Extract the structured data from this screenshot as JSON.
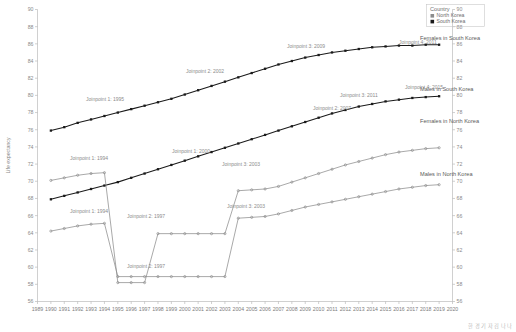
{
  "chart_data": {
    "type": "line",
    "title": "",
    "xlabel": "",
    "ylabel": "Life expectancy",
    "xlim": [
      1989,
      2020
    ],
    "ylim": [
      56,
      90
    ],
    "ytick_step": 2,
    "grid": false,
    "x_ticks": [
      "1989",
      "1990",
      "1991",
      "1992",
      "1993",
      "1994",
      "1995",
      "1996",
      "1997",
      "1998",
      "1999",
      "2000",
      "2001",
      "2002",
      "2003",
      "2004",
      "2005",
      "2006",
      "2007",
      "2008",
      "2009",
      "2010",
      "2011",
      "2012",
      "2013",
      "2014",
      "2015",
      "2016",
      "2017",
      "2018",
      "2019",
      "2020"
    ],
    "y_ticks": [
      "56",
      "58",
      "60",
      "62",
      "64",
      "66",
      "68",
      "70",
      "72",
      "74",
      "76",
      "78",
      "80",
      "82",
      "84",
      "86",
      "88",
      "90"
    ],
    "x": [
      1990,
      1991,
      1992,
      1993,
      1994,
      1995,
      1996,
      1997,
      1998,
      1999,
      2000,
      2001,
      2002,
      2003,
      2004,
      2005,
      2006,
      2007,
      2008,
      2009,
      2010,
      2011,
      2012,
      2013,
      2014,
      2015,
      2016,
      2017,
      2018,
      2019
    ],
    "series": [
      {
        "name": "Females in South Korea",
        "country": "South Korea",
        "color": "#1a1a1a",
        "marker": "square",
        "values": [
          75.9,
          76.3,
          76.8,
          77.2,
          77.6,
          78.0,
          78.4,
          78.8,
          79.2,
          79.6,
          80.1,
          80.6,
          81.1,
          81.6,
          82.1,
          82.6,
          83.1,
          83.6,
          84.0,
          84.4,
          84.7,
          85.0,
          85.2,
          85.4,
          85.6,
          85.7,
          85.8,
          85.8,
          85.9,
          85.9
        ]
      },
      {
        "name": "Males in South Korea",
        "country": "South Korea",
        "color": "#1a1a1a",
        "marker": "square",
        "values": [
          67.9,
          68.3,
          68.7,
          69.1,
          69.5,
          69.9,
          70.4,
          70.9,
          71.4,
          71.9,
          72.4,
          72.9,
          73.4,
          73.9,
          74.4,
          74.9,
          75.4,
          75.9,
          76.4,
          76.9,
          77.4,
          77.9,
          78.3,
          78.7,
          79.0,
          79.3,
          79.5,
          79.7,
          79.8,
          79.9
        ]
      },
      {
        "name": "Females in North Korea",
        "country": "North Korea",
        "color": "#8c8c8c",
        "marker": "circle",
        "values": [
          70.1,
          70.4,
          70.7,
          70.9,
          71.0,
          58.2,
          58.2,
          58.2,
          63.9,
          63.9,
          63.9,
          63.9,
          63.9,
          63.9,
          68.9,
          69.0,
          69.1,
          69.4,
          69.9,
          70.4,
          70.9,
          71.4,
          71.9,
          72.3,
          72.7,
          73.1,
          73.4,
          73.6,
          73.8,
          73.9
        ]
      },
      {
        "name": "Males in North Korea",
        "country": "North Korea",
        "color": "#8c8c8c",
        "marker": "circle",
        "values": [
          64.2,
          64.5,
          64.8,
          65.0,
          65.1,
          58.9,
          58.9,
          58.9,
          58.9,
          58.9,
          58.9,
          58.9,
          58.9,
          58.9,
          65.7,
          65.8,
          65.9,
          66.2,
          66.6,
          67.0,
          67.3,
          67.6,
          67.9,
          68.2,
          68.5,
          68.8,
          69.1,
          69.3,
          69.5,
          69.6
        ]
      }
    ],
    "annotations": [
      {
        "text": "Joinpoint 1: 1995",
        "series": "Females in South Korea"
      },
      {
        "text": "Joinpoint 2: 2002",
        "series": "Females in South Korea"
      },
      {
        "text": "Joinpoint 3: 2009",
        "series": "Females in South Korea"
      },
      {
        "text": "Joinpoint 4: 2011",
        "series": "Females in South Korea"
      },
      {
        "text": "Joinpoint 1: 2000",
        "series": "Males in South Korea"
      },
      {
        "text": "Joinpoint 2: 2007",
        "series": "Males in South Korea"
      },
      {
        "text": "Joinpoint 3: 2011",
        "series": "Males in South Korea"
      },
      {
        "text": "Joinpoint 4: 2015",
        "series": "Males in South Korea"
      },
      {
        "text": "Joinpoint 1: 1994",
        "series": "Females in North Korea"
      },
      {
        "text": "Joinpoint 2: 1997",
        "series": "Females in North Korea"
      },
      {
        "text": "Joinpoint 3: 2003",
        "series": "Females in North Korea"
      },
      {
        "text": "Joinpoint 1: 1994",
        "series": "Males in North Korea"
      },
      {
        "text": "Joinpoint 2: 1997",
        "series": "Males in North Korea"
      },
      {
        "text": "Joinpoint 3: 2003",
        "series": "Males in North Korea"
      }
    ]
  },
  "legend": {
    "title": "Country",
    "items": [
      {
        "label": "North Korea",
        "color": "#8c8c8c"
      },
      {
        "label": "South Korea",
        "color": "#1a1a1a"
      }
    ]
  },
  "series_labels": [
    {
      "text": "Females in South Korea"
    },
    {
      "text": "Males in South Korea"
    },
    {
      "text": "Females in North Korea"
    },
    {
      "text": "Males  in North Korea"
    }
  ],
  "joinpoint_labels": [
    {
      "text": "Joinpoint 1: 1995"
    },
    {
      "text": "Joinpoint 2: 2002"
    },
    {
      "text": "Joinpoint 3: 2009"
    },
    {
      "text": "Joinpoint 4: 2011"
    },
    {
      "text": "Joinpoint 1: 2000"
    },
    {
      "text": "Joinpoint 2: 2007"
    },
    {
      "text": "Joinpoint 3: 2011"
    },
    {
      "text": "Joinpoint 4: 2015"
    },
    {
      "text": "Joinpoint 1: 1994"
    },
    {
      "text": "Joinpoint 2: 1997"
    },
    {
      "text": "Joinpoint 3: 2003"
    },
    {
      "text": "Joinpoint 1: 1994"
    },
    {
      "text": "Joinpoint 2: 1997"
    },
    {
      "text": "Joinpoint 3: 2003"
    }
  ],
  "axis": {
    "ylabel": "Life expectancy"
  },
  "credit": {
    "text": "한 경 기 자  김 나 나"
  }
}
